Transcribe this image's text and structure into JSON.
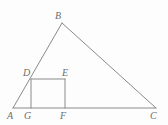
{
  "figure": {
    "background_color": "#fdfdfd",
    "stroke_color": "#8a8a8a",
    "label_color": "#6d6d6d",
    "stroke_width": 1,
    "width": 168,
    "height": 125,
    "points": {
      "A": {
        "label": "A",
        "x": 13,
        "y": 108,
        "label_x": 7,
        "label_y": 111
      },
      "B": {
        "label": "B",
        "x": 62,
        "y": 23,
        "label_x": 55,
        "label_y": 11
      },
      "C": {
        "label": "C",
        "x": 156,
        "y": 108,
        "label_x": 150,
        "label_y": 111
      },
      "D": {
        "label": "D",
        "x": 31,
        "y": 79,
        "label_x": 23,
        "label_y": 68
      },
      "E": {
        "label": "E",
        "x": 65,
        "y": 79,
        "label_x": 62,
        "label_y": 68
      },
      "F": {
        "label": "F",
        "x": 65,
        "y": 108,
        "label_x": 60,
        "label_y": 111
      },
      "G": {
        "label": "G",
        "x": 31,
        "y": 108,
        "label_x": 24,
        "label_y": 111
      }
    },
    "segments": [
      {
        "name": "side-AB",
        "from": "A",
        "to": "B"
      },
      {
        "name": "side-BC",
        "from": "B",
        "to": "C"
      },
      {
        "name": "side-AC",
        "from": "A",
        "to": "C"
      },
      {
        "name": "square-top-DE",
        "from": "D",
        "to": "E"
      },
      {
        "name": "square-left-DG",
        "from": "D",
        "to": "G"
      },
      {
        "name": "square-right-EF",
        "from": "E",
        "to": "F"
      }
    ]
  }
}
